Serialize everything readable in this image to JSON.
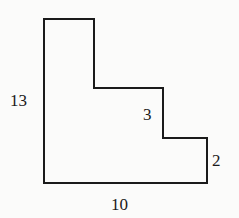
{
  "figure": {
    "type": "composite-rectilinear-shape",
    "stroke_color": "#1a1a1a",
    "background_color": "#fbfbfa",
    "outline_points": [
      [
        44,
        19
      ],
      [
        94,
        19
      ],
      [
        94,
        88
      ],
      [
        163,
        88
      ],
      [
        163,
        138
      ],
      [
        207,
        138
      ],
      [
        207,
        183
      ],
      [
        44,
        183
      ]
    ],
    "labels": {
      "left_side": "13",
      "middle_step": "3",
      "right_side": "2",
      "bottom_side": "10"
    }
  }
}
